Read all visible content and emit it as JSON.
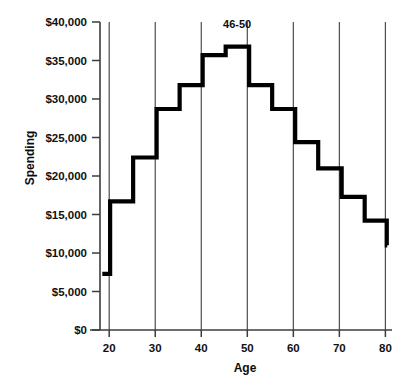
{
  "chart_data": {
    "type": "line",
    "title": "",
    "subtitle": "",
    "xlabel": "Age",
    "ylabel": "Spending",
    "xlim": [
      18,
      81
    ],
    "ylim": [
      0,
      40000
    ],
    "grid": "vertical-only",
    "legend_position": "none",
    "style": "step",
    "x_ticks": [
      20,
      30,
      40,
      50,
      60,
      70,
      80
    ],
    "x_tick_labels": [
      "20",
      "30",
      "40",
      "50",
      "60",
      "70",
      "80"
    ],
    "y_ticks": [
      0,
      5000,
      10000,
      15000,
      20000,
      25000,
      30000,
      35000,
      40000
    ],
    "y_tick_labels": [
      "$0",
      "$5,000",
      "$10,000",
      "$15,000",
      "$20,000",
      "$25,000",
      "$30,000",
      "$35,000",
      "$40,000"
    ],
    "categories": [
      "<21",
      "21-25",
      "26-30",
      "31-35",
      "36-40",
      "41-45",
      "46-50",
      "51-55",
      "56-60",
      "61-65",
      "66-70",
      "71-75",
      "76-80",
      ">80"
    ],
    "series": [
      {
        "name": "Spending",
        "color": "#000000",
        "values": [
          7300,
          16700,
          22400,
          28700,
          31800,
          35700,
          36800,
          31800,
          28700,
          24400,
          21000,
          17300,
          14200,
          11000
        ]
      }
    ],
    "steps": [
      {
        "label": "<21",
        "x_start": 18.5,
        "x_end": 20.2,
        "value": 7300
      },
      {
        "label": "21-25",
        "x_start": 20.2,
        "x_end": 25.2,
        "value": 16700
      },
      {
        "label": "26-30",
        "x_start": 25.2,
        "x_end": 30.3,
        "value": 22400
      },
      {
        "label": "31-35",
        "x_start": 30.3,
        "x_end": 35.3,
        "value": 28700
      },
      {
        "label": "36-40",
        "x_start": 35.3,
        "x_end": 40.3,
        "value": 31800
      },
      {
        "label": "41-45",
        "x_start": 40.3,
        "x_end": 45.3,
        "value": 35700
      },
      {
        "label": "46-50",
        "x_start": 45.3,
        "x_end": 50.4,
        "value": 36800
      },
      {
        "label": "51-55",
        "x_start": 50.4,
        "x_end": 55.4,
        "value": 31800
      },
      {
        "label": "56-60",
        "x_start": 55.4,
        "x_end": 60.4,
        "value": 28700
      },
      {
        "label": "61-65",
        "x_start": 60.4,
        "x_end": 65.4,
        "value": 24400
      },
      {
        "label": "66-70",
        "x_start": 65.4,
        "x_end": 70.5,
        "value": 21000
      },
      {
        "label": "71-75",
        "x_start": 70.5,
        "x_end": 75.5,
        "value": 17300
      },
      {
        "label": "76-80",
        "x_start": 75.5,
        "x_end": 80.3,
        "value": 14200
      },
      {
        "label": ">80",
        "x_start": 80.3,
        "x_end": 80.4,
        "value": 11000
      }
    ],
    "annotations": [
      {
        "text": "46-50",
        "x": 47.8,
        "y": 39200,
        "style": "bold"
      }
    ]
  },
  "axes": {
    "y_title": "Spending",
    "x_title": "Age",
    "y_labels": [
      "$40,000",
      "$35,000",
      "$30,000",
      "$25,000",
      "$20,000",
      "$15,000",
      "$10,000",
      "$5,000",
      "$0"
    ],
    "x_labels": [
      "20",
      "30",
      "40",
      "50",
      "60",
      "70",
      "80"
    ]
  },
  "annotation": {
    "peak_label": "46-50"
  },
  "colors": {
    "line": "#000000",
    "gridline": "#4d4d4d",
    "axis": "#3d3d3d",
    "text": "#111111",
    "background": "#ffffff"
  }
}
